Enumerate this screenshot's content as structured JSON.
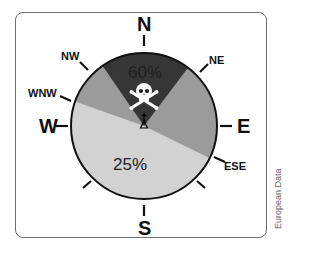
{
  "diagram": {
    "type": "wind-rose-pie",
    "compass": {
      "N": "N",
      "S": "S",
      "E": "E",
      "W": "W",
      "NE": "NE",
      "NW": "NW",
      "WNW": "WNW",
      "ESE": "ESE"
    },
    "segments": [
      {
        "label": "60%",
        "from": "NW",
        "to": "NE",
        "color": "#3a3a3a"
      },
      {
        "label": "",
        "from": "NE",
        "to": "ESE",
        "color": "#9b9b9b"
      },
      {
        "label": "25%",
        "from": "ESE",
        "to": "WNW",
        "color": "#d4d4d4"
      },
      {
        "label": "",
        "from": "WNW",
        "to": "NW",
        "color": "#9b9b9b"
      }
    ],
    "center_icon": "skull-and-crossbones-icon",
    "credit": "European Data"
  }
}
